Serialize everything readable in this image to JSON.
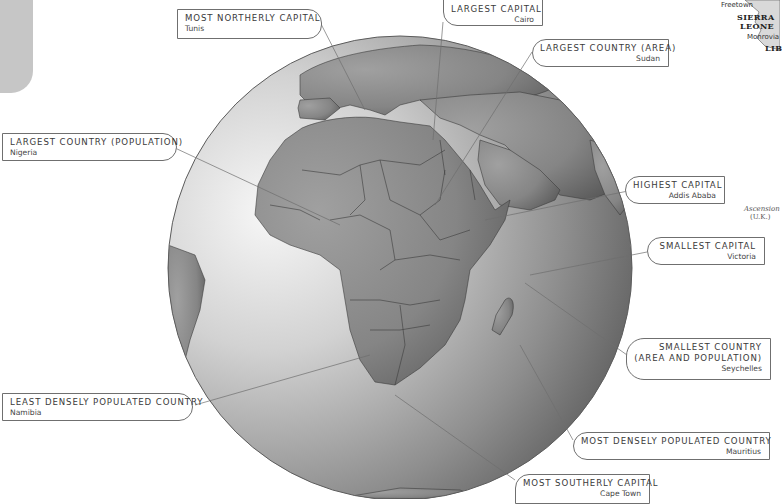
{
  "map": {
    "title": "Africa globe — record holders",
    "colors": {
      "ocean_light": "#f4f4f4",
      "ocean_dark": "#6e6e6e",
      "land": "#8c8c8c",
      "border": "#3d3d3d",
      "label_border": "#6f6f6f",
      "tab": "#c6c6c6"
    },
    "labels": [
      {
        "id": "most-northerly-capital",
        "title": "MOST NORTHERLY CAPITAL",
        "value": "Tunis"
      },
      {
        "id": "largest-capital",
        "title": "LARGEST CAPITAL",
        "value": "Cairo"
      },
      {
        "id": "largest-country-area",
        "title": "LARGEST COUNTRY (AREA)",
        "value": "Sudan"
      },
      {
        "id": "largest-country-population",
        "title": "LARGEST COUNTRY (POPULATION)",
        "value": "Nigeria"
      },
      {
        "id": "highest-capital",
        "title": "HIGHEST CAPITAL",
        "value": "Addis Ababa"
      },
      {
        "id": "smallest-capital",
        "title": "SMALLEST CAPITAL",
        "value": "Victoria"
      },
      {
        "id": "smallest-country",
        "title": "SMALLEST COUNTRY",
        "title2": "(AREA AND POPULATION)",
        "value": "Seychelles"
      },
      {
        "id": "least-densely-populated",
        "title": "LEAST DENSELY POPULATED COUNTRY",
        "value": "Namibia"
      },
      {
        "id": "most-densely-populated",
        "title": "MOST DENSELY POPULATED COUNTRY",
        "value": "Mauritius"
      },
      {
        "id": "most-southerly-capital",
        "title": "MOST SOUTHERLY CAPITAL",
        "value": "Cape Town"
      }
    ],
    "inset": {
      "cities": [
        "Freetown",
        "Monrovia"
      ],
      "countries": [
        "SIERRA",
        "LEONE",
        "LIB"
      ],
      "island": "Ascension",
      "island_note": "(U.K.)"
    }
  }
}
